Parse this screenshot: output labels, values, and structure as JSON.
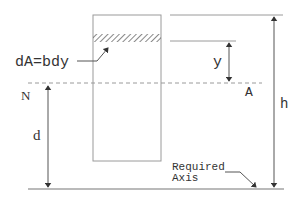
{
  "diagram": {
    "labels": {
      "element": "dA=bdy",
      "y": "y",
      "neutral_left": "N",
      "neutral_right": "A",
      "d": "d",
      "h": "h",
      "required_axis_line1": "Required",
      "required_axis_line2": "Axis"
    },
    "colors": {
      "line": "#8a8a8a",
      "text": "#333333",
      "hatch": "#555555"
    }
  }
}
